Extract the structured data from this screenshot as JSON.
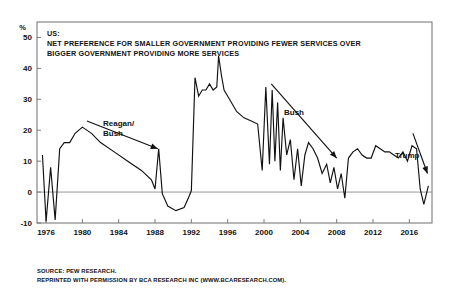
{
  "figure": {
    "title_lines": [
      "US:",
      "NET PREFERENCE FOR SMALLER GOVERNMENT PROVIDING FEWER SERVICES OVER",
      "BIGGER GOVERNMENT PROVIDING MORE SERVICES"
    ],
    "axis_unit": "%",
    "footer_lines": [
      "SOURCE: PEW RESEARCH.",
      "REPRINTED WITH PERMISSION BY BCA RESEARCH INC (WWW.BCARESEARCH.COM)."
    ],
    "colors": {
      "line": "#111111",
      "axis": "#6f6f6f",
      "zero_line": "#8a8a8a",
      "background": "#ffffff",
      "text": "#111111"
    }
  },
  "annotations": [
    {
      "label": "Reagan/",
      "label2": "Bush",
      "name": "reagan-bush"
    },
    {
      "label": "Bush",
      "name": "bush"
    },
    {
      "label": "Trump",
      "name": "trump"
    }
  ],
  "chart_data": {
    "type": "line",
    "xlabel": "",
    "ylabel": "%",
    "xlim": [
      1975.0,
      2018.5
    ],
    "ylim": [
      -10,
      55
    ],
    "yticks": [
      -10,
      0,
      10,
      20,
      30,
      40,
      50
    ],
    "ytick_labels": [
      "-10",
      "0",
      "10",
      "20",
      "30",
      "40",
      "50"
    ],
    "xticks": [
      1976,
      1980,
      1984,
      1988,
      1992,
      1996,
      2000,
      2004,
      2008,
      2012,
      2016
    ],
    "xtick_labels": [
      "1976",
      "1980",
      "1984",
      "1988",
      "1992",
      "1996",
      "2000",
      "2004",
      "2008",
      "2012",
      "2016"
    ],
    "grid": false,
    "legend": false,
    "source": "PEW RESEARCH",
    "series": [
      {
        "name": "Net preference for smaller government",
        "x": [
          1975.6,
          1976.0,
          1976.5,
          1977.0,
          1977.5,
          1978.0,
          1978.6,
          1979.2,
          1980.0,
          1981.0,
          1982.0,
          1983.5,
          1985.0,
          1986.5,
          1987.6,
          1988.0,
          1988.4,
          1988.8,
          1989.4,
          1990.3,
          1991.2,
          1991.8,
          1992.0,
          1992.4,
          1992.8,
          1993.2,
          1993.6,
          1994.0,
          1994.4,
          1994.8,
          1995.0,
          1995.3,
          1995.6,
          1996.2,
          1997.0,
          1997.8,
          1998.6,
          1999.3,
          1999.8,
          2000.2,
          2000.6,
          2000.9,
          2001.2,
          2001.5,
          2001.8,
          2002.1,
          2002.5,
          2002.9,
          2003.3,
          2003.7,
          2004.1,
          2004.5,
          2004.9,
          2005.4,
          2005.9,
          2006.4,
          2006.9,
          2007.3,
          2007.7,
          2008.1,
          2008.5,
          2008.9,
          2009.3,
          2009.8,
          2010.3,
          2010.8,
          2011.3,
          2011.8,
          2012.3,
          2012.8,
          2013.3,
          2013.8,
          2014.3,
          2014.8,
          2015.3,
          2015.8,
          2016.3,
          2016.8,
          2017.2,
          2017.6,
          2018.1
        ],
        "y": [
          12,
          -9.5,
          8,
          -9,
          14,
          16,
          16,
          19,
          21,
          19,
          16,
          13,
          10,
          7,
          4,
          1,
          14,
          -0.5,
          -4.5,
          -6,
          -5,
          -1,
          0.5,
          37,
          31,
          33,
          33,
          35,
          33,
          34,
          44,
          38,
          33,
          30,
          26,
          24,
          23,
          22,
          7,
          34,
          9,
          33,
          10,
          29,
          7,
          24,
          12,
          17,
          4,
          14,
          2,
          12,
          16,
          14,
          11,
          6,
          9,
          3,
          8,
          1,
          6,
          -2,
          11,
          13,
          14,
          12,
          11,
          11,
          15,
          14,
          13,
          13,
          12,
          11,
          13,
          10,
          15,
          14,
          1,
          -4,
          2
        ]
      }
    ],
    "annotations": [
      {
        "text": "Reagan/ Bush",
        "from_year": 1980.5,
        "from_value": 23,
        "to_year": 1988.3,
        "to_value": 14
      },
      {
        "text": "Bush",
        "from_year": 2000.8,
        "from_value": 35,
        "to_year": 2008.0,
        "to_value": 11
      },
      {
        "text": "Trump",
        "from_year": 2016.4,
        "from_value": 19,
        "to_year": 2018.0,
        "to_value": 6
      }
    ]
  }
}
